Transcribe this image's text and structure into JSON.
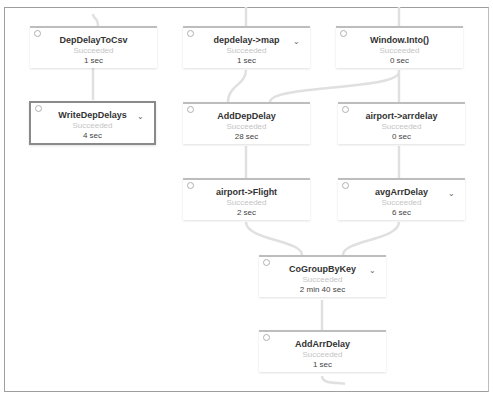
{
  "graph": {
    "nodes": [
      {
        "id": "n1",
        "title": "DepDelayToCsv",
        "status": "Succeeded",
        "duration": "1 sec",
        "expandable": false,
        "selected": false
      },
      {
        "id": "n2",
        "title": "depdelay->map",
        "status": "Succeeded",
        "duration": "1 sec",
        "expandable": true,
        "selected": false
      },
      {
        "id": "n3",
        "title": "Window.Into()",
        "status": "Succeeded",
        "duration": "0 sec",
        "expandable": false,
        "selected": false
      },
      {
        "id": "n4",
        "title": "WriteDepDelays",
        "status": "Succeeded",
        "duration": "4 sec",
        "expandable": true,
        "selected": true
      },
      {
        "id": "n5",
        "title": "AddDepDelay",
        "status": "Succeeded",
        "duration": "28 sec",
        "expandable": false,
        "selected": false
      },
      {
        "id": "n6",
        "title": "airport->arrdelay",
        "status": "Succeeded",
        "duration": "0 sec",
        "expandable": false,
        "selected": false
      },
      {
        "id": "n7",
        "title": "airport->Flight",
        "status": "Succeeded",
        "duration": "2 sec",
        "expandable": false,
        "selected": false
      },
      {
        "id": "n8",
        "title": "avgArrDelay",
        "status": "Succeeded",
        "duration": "6 sec",
        "expandable": true,
        "selected": false
      },
      {
        "id": "n9",
        "title": "CoGroupByKey",
        "status": "Succeeded",
        "duration": "2 min 40 sec",
        "expandable": true,
        "selected": false
      },
      {
        "id": "n10",
        "title": "AddArrDelay",
        "status": "Succeeded",
        "duration": "1 sec",
        "expandable": false,
        "selected": false
      }
    ],
    "icons": {
      "check": "check-circle-icon",
      "chevron": "⌄"
    }
  }
}
